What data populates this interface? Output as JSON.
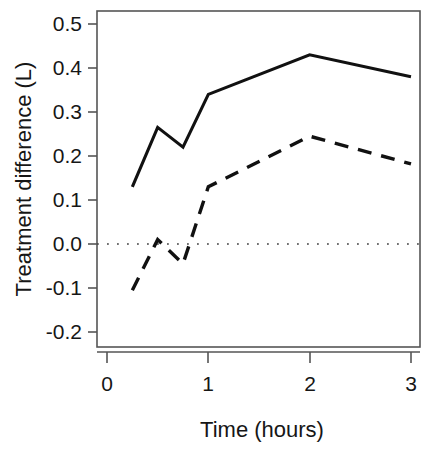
{
  "chart_data": {
    "type": "line",
    "title": "",
    "subtitle": "",
    "xlabel": "Time (hours)",
    "ylabel": "Treatment difference (L)",
    "xlim": [
      0,
      3.1
    ],
    "ylim": [
      -0.22,
      0.54
    ],
    "xticks": [
      0,
      1,
      2,
      3
    ],
    "xticklabels": [
      "0",
      "1",
      "2",
      "3"
    ],
    "yticks": [
      -0.2,
      -0.1,
      0.0,
      0.1,
      0.2,
      0.3,
      0.4,
      0.5
    ],
    "yticklabels": [
      "-0.2",
      "-0.1",
      "0.0",
      "0.1",
      "0.2",
      "0.3",
      "0.4",
      "0.5"
    ],
    "grid": false,
    "legend": "none",
    "frame": true,
    "annotations": [
      {
        "name": "zero-reference-line",
        "type": "hline",
        "y": 0.0,
        "style": "dotted"
      }
    ],
    "x": [
      0.25,
      0.5,
      0.75,
      1.0,
      2.0,
      3.0
    ],
    "series": [
      {
        "name": "solid-series",
        "style": "solid",
        "color": "#111111",
        "x": [
          0.25,
          0.5,
          0.75,
          1.0,
          2.0,
          3.0
        ],
        "values": [
          0.13,
          0.265,
          0.22,
          0.34,
          0.43,
          0.38
        ]
      },
      {
        "name": "dashed-series",
        "style": "dashed",
        "color": "#111111",
        "x": [
          0.25,
          0.5,
          0.75,
          1.0,
          2.0,
          3.0
        ],
        "values": [
          -0.105,
          0.01,
          -0.045,
          0.13,
          0.245,
          0.182
        ]
      }
    ]
  },
  "colors": {
    "background": "#ffffff",
    "axis": "#4a4a4a",
    "text": "#161616",
    "line": "#111111",
    "reference": "#555555"
  },
  "axes": {
    "x_title": "Time (hours)",
    "y_title": "Treatment difference (L)"
  }
}
